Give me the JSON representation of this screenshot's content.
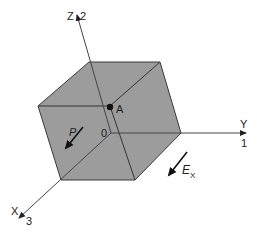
{
  "diagram": {
    "type": "3d-cube-with-axes",
    "colors": {
      "cube_fill": "#9c9c9c",
      "edge": "#3a3a3a",
      "axis": "#444444",
      "text": "#222222",
      "background": "#ffffff"
    },
    "axes": {
      "z": {
        "label": "Z",
        "index": "2"
      },
      "y": {
        "label": "Y",
        "index": "1"
      },
      "x": {
        "label": "X",
        "index": "3"
      }
    },
    "origin_label": "0",
    "point": {
      "label": "A"
    },
    "vectors": {
      "polarization": {
        "label": "P"
      },
      "field": {
        "label": "E",
        "subscript": "X"
      }
    }
  }
}
